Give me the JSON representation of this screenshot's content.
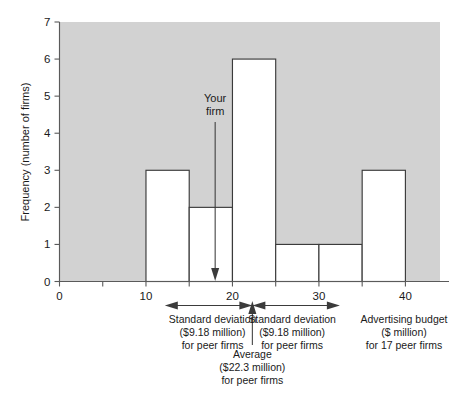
{
  "chart_data": {
    "type": "bar",
    "title": "",
    "subtitle": "",
    "xlabel": "Advertising budget ($ million) for 17 peer firms",
    "ylabel": "Frequency (number of firms)",
    "xlim": [
      0,
      44
    ],
    "ylim": [
      0,
      7
    ],
    "grid": false,
    "legend": "none",
    "histogram": true,
    "bin_width": 5,
    "bin_edges": [
      5,
      10,
      15,
      20,
      25,
      30,
      35,
      40
    ],
    "categories": [
      "5-10",
      "10-15",
      "15-20",
      "20-25",
      "25-30",
      "30-35",
      "35-40"
    ],
    "values": [
      1,
      3,
      2,
      6,
      1,
      1,
      3
    ],
    "total_firms": 17,
    "x_ticks": [
      0,
      5,
      10,
      15,
      20,
      25,
      30,
      35,
      40
    ],
    "x_tick_labels": [
      "0",
      "",
      "10",
      "",
      "20",
      "",
      "30",
      "",
      "40"
    ],
    "y_ticks": [
      0,
      1,
      2,
      3,
      4,
      5,
      6,
      7
    ],
    "y_tick_labels": [
      "0",
      "1",
      "2",
      "3",
      "4",
      "5",
      "6",
      "7"
    ],
    "annotations": [
      {
        "name": "your-firm",
        "label_line1": "Your",
        "label_line2": "firm",
        "x_value": 18.0,
        "type": "down-arrow"
      },
      {
        "name": "average-marker",
        "x_value": 22.3,
        "type": "up-arrow"
      },
      {
        "name": "sd-left",
        "from_x": 13.1,
        "to_x": 22.3,
        "type": "double-arrow"
      },
      {
        "name": "sd-right",
        "from_x": 22.3,
        "to_x": 31.5,
        "type": "double-arrow"
      }
    ],
    "plot_background": "#d2d2d2",
    "bar_fill": "#ffffff",
    "bar_stroke": "#3b3b3b"
  },
  "axes": {
    "y_title": "Frequency (number of firms)",
    "y_labels": [
      "0",
      "1",
      "2",
      "3",
      "4",
      "5",
      "6",
      "7"
    ],
    "x_labels": [
      "0",
      "10",
      "20",
      "30",
      "40"
    ]
  },
  "callouts": {
    "your_firm": {
      "line1": "Your",
      "line2": "firm"
    },
    "sd_left": {
      "line1": "Standard deviation",
      "line2": "($9.18 million)",
      "line3": "for peer firms"
    },
    "sd_right": {
      "line1": "Standard deviation",
      "line2": "($9.18 million)",
      "line3": "for peer firms"
    },
    "average": {
      "line1": "Average",
      "line2": "($22.3 million)",
      "line3": "for peer firms"
    },
    "x_caption": {
      "line1": "Advertising budget",
      "line2": "($ million)",
      "line3": "for 17 peer firms"
    }
  }
}
